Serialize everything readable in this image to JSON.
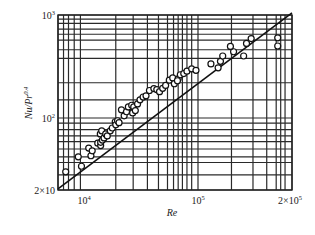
{
  "chart_data": {
    "type": "scatter",
    "title": "",
    "xlabel": "Re",
    "ylabel": "Nu/Pr^0.4",
    "ylabel_parts": {
      "base": "Nu/Pr",
      "exp": "0.4"
    },
    "xscale": "log",
    "yscale": "log",
    "xlim": [
      5900,
      200000
    ],
    "ylim": [
      20,
      1000
    ],
    "grid": true,
    "legend": "none",
    "x_ticks": [
      {
        "value": 10000,
        "base": "10",
        "exp": "4"
      },
      {
        "value": 100000,
        "base": "10",
        "exp": "5"
      },
      {
        "value": 200000,
        "base": "2×10",
        "exp": "5"
      }
    ],
    "y_ticks": [
      {
        "value": 1000,
        "base": "10",
        "exp": "3"
      },
      {
        "value": 100,
        "base": "10",
        "exp": "2"
      },
      {
        "value": 20,
        "base": "2×10",
        "exp": ""
      }
    ],
    "x_gridlines": [
      5900,
      6600,
      7300,
      8200,
      9300,
      19000,
      27000,
      36000,
      45000,
      54000,
      61000,
      67000,
      73000,
      80000,
      88000,
      100000,
      128000,
      150000,
      166000,
      178000,
      184000,
      190000,
      200000
    ],
    "y_gridlines": [
      1000,
      910,
      830,
      730,
      650,
      570,
      460,
      380,
      220,
      150,
      100,
      89,
      77,
      67,
      59,
      50,
      42,
      37,
      28,
      20
    ],
    "fit_line": {
      "points": [
        [
          5900,
          20.5
        ],
        [
          200000,
          1050
        ]
      ]
    },
    "series": [
      {
        "name": "experimental data",
        "marker": "open-circle",
        "points": [
          [
            6900,
            30
          ],
          [
            8900,
            42
          ],
          [
            9500,
            34
          ],
          [
            11000,
            51
          ],
          [
            11500,
            43
          ],
          [
            11800,
            48
          ],
          [
            13200,
            57
          ],
          [
            14000,
            54
          ],
          [
            13900,
            70
          ],
          [
            14300,
            75
          ],
          [
            14000,
            58
          ],
          [
            14500,
            61
          ],
          [
            15000,
            64
          ],
          [
            15500,
            70
          ],
          [
            16000,
            67
          ],
          [
            17000,
            75
          ],
          [
            17700,
            80
          ],
          [
            18800,
            92
          ],
          [
            19000,
            86
          ],
          [
            19700,
            94
          ],
          [
            20300,
            90
          ],
          [
            22500,
            105
          ],
          [
            21300,
            120
          ],
          [
            23600,
            115
          ],
          [
            24500,
            128
          ],
          [
            26200,
            133
          ],
          [
            27300,
            128
          ],
          [
            26700,
            112
          ],
          [
            28200,
            118
          ],
          [
            29500,
            137
          ],
          [
            31000,
            150
          ],
          [
            33000,
            160
          ],
          [
            35000,
            164
          ],
          [
            37500,
            185
          ],
          [
            41000,
            193
          ],
          [
            43500,
            189
          ],
          [
            46000,
            180
          ],
          [
            49000,
            194
          ],
          [
            52000,
            207
          ],
          [
            56000,
            233
          ],
          [
            60000,
            245
          ],
          [
            67000,
            240
          ],
          [
            70000,
            263
          ],
          [
            62000,
            215
          ],
          [
            66000,
            230
          ],
          [
            75000,
            270
          ],
          [
            80000,
            285
          ],
          [
            88000,
            300
          ],
          [
            96000,
            290
          ],
          [
            110000,
            335
          ],
          [
            118000,
            355
          ],
          [
            116000,
            307
          ],
          [
            120000,
            400
          ],
          [
            130000,
            440
          ],
          [
            127000,
            495
          ],
          [
            140000,
            400
          ],
          [
            143000,
            530
          ],
          [
            148000,
            590
          ],
          [
            180000,
            500
          ],
          [
            180000,
            600
          ]
        ]
      }
    ]
  }
}
